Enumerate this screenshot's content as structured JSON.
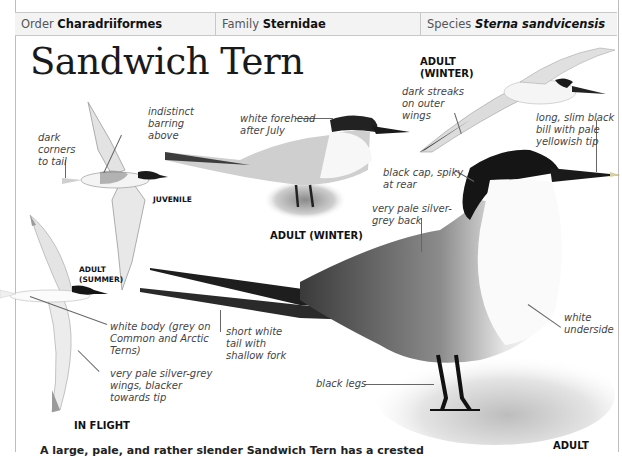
{
  "header": {
    "order_label": "Order",
    "order_value": "Charadriiformes",
    "family_label": "Family",
    "family_value": "Sternidae",
    "species_label": "Species",
    "species_value": "Sterna sandvicensis"
  },
  "title": "Sandwich Tern",
  "figures": {
    "juvenile_flight": {
      "caption": "JUVENILE",
      "labels": [
        "indistinct\nbarring\nabove",
        "dark\ncorners\nto tail"
      ]
    },
    "adult_summer_flight": {
      "caption": "ADULT\n(SUMMER)",
      "labels": [
        "white body (grey on\nCommon and Arctic\nTerns)",
        "very pale silver-grey\nwings, blacker\ntowards tip"
      ]
    },
    "in_flight_caption": "IN FLIGHT",
    "adult_winter_standing": {
      "caption": "ADULT (WINTER)",
      "labels": [
        "white forehead\nafter July"
      ]
    },
    "adult_winter_flight": {
      "caption": "ADULT\n(WINTER)",
      "labels": [
        "dark streaks\non outer\nwings"
      ]
    },
    "adult_standing": {
      "caption": "ADULT",
      "labels": [
        "long, slim black\nbill with pale\nyellowish tip",
        "black cap, spiky\nat rear",
        "very pale silver-\ngrey back",
        "white\nunderside",
        "short white\ntail with\nshallow fork",
        "black legs"
      ]
    }
  },
  "footer_text_cut": "A large, pale, and rather slender Sandwich Tern has a crested"
}
